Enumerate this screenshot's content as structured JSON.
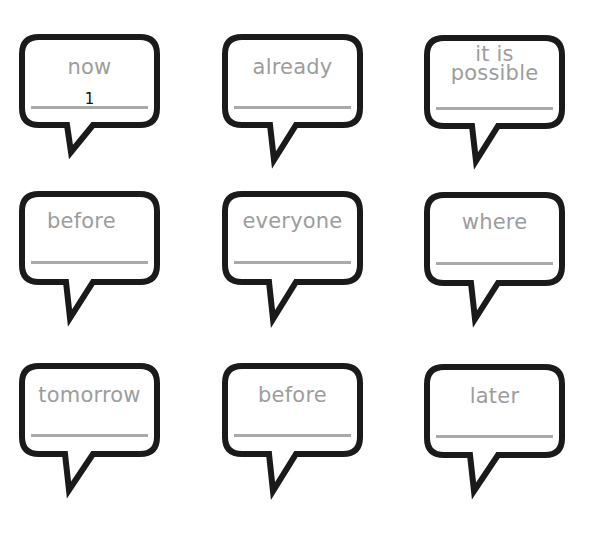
{
  "worksheet": {
    "colors": {
      "bubble_outline": "#1a1a1a",
      "word_text": "#9d9d9d",
      "answer_line": "#a9a9a9",
      "answer_text": "#111111",
      "background": "#ffffff"
    },
    "bubbles": [
      {
        "word": "now",
        "answer": "1"
      },
      {
        "word": "already",
        "answer": ""
      },
      {
        "word_line1": "it is",
        "word_line2": "possible",
        "answer": ""
      },
      {
        "word": "before",
        "answer": ""
      },
      {
        "word": "everyone",
        "answer": ""
      },
      {
        "word": "where",
        "answer": ""
      },
      {
        "word": "tomorrow",
        "answer": ""
      },
      {
        "word": "before",
        "answer": ""
      },
      {
        "word": "later",
        "answer": ""
      }
    ]
  }
}
